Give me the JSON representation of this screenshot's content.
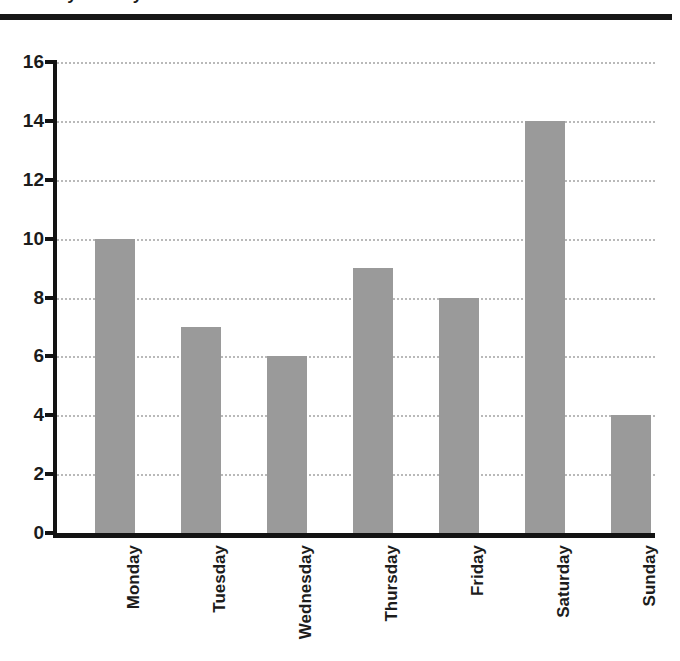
{
  "header": {
    "title_fragment": "Daily Activity",
    "rule": "horizontal-rule"
  },
  "chart_data": {
    "type": "bar",
    "title": "",
    "xlabel": "",
    "ylabel": "",
    "categories": [
      "Monday",
      "Tuesday",
      "Wednesday",
      "Thursday",
      "Friday",
      "Saturday",
      "Sunday"
    ],
    "values": [
      10,
      7,
      6,
      9,
      8,
      14,
      4
    ],
    "ylim": [
      0,
      16
    ],
    "ytick_labels": [
      "16",
      "14",
      "12",
      "10",
      "8",
      "6",
      "4",
      "2",
      "0"
    ],
    "ytick_values": [
      16,
      14,
      12,
      10,
      8,
      6,
      4,
      2,
      0
    ],
    "grid": "horizontal-dotted",
    "legend": "none",
    "bar_color": "#9a9a9a",
    "axis_color": "#131313",
    "grid_color": "#b9b9b9",
    "background": "#ffffff"
  }
}
